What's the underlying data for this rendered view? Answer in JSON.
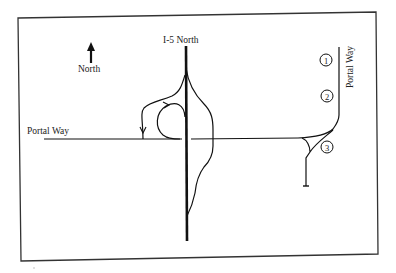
{
  "diagram": {
    "type": "road interchange map",
    "labels": {
      "north": "North",
      "highway": "I-5 North",
      "portal_way_west": "Portal Way",
      "portal_way_east": "Portal Way"
    },
    "markers": [
      {
        "id": "1",
        "label": "1"
      },
      {
        "id": "2",
        "label": "2"
      },
      {
        "id": "3",
        "label": "3"
      }
    ],
    "colors": {
      "stroke": "#1a1a1a",
      "background": "#ffffff",
      "border": "#333333"
    }
  }
}
